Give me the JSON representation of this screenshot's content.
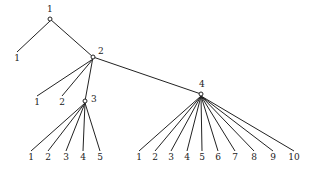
{
  "diagram": {
    "type": "tree",
    "nodes": [
      {
        "id": "n1",
        "label": "1",
        "x": 50,
        "y": 19,
        "lx": 47,
        "ly": 12,
        "marker": "circle"
      },
      {
        "id": "n2",
        "label": "2",
        "x": 93,
        "y": 57,
        "lx": 98,
        "ly": 54,
        "marker": "circle"
      },
      {
        "id": "n3",
        "label": "3",
        "x": 85,
        "y": 101,
        "lx": 91,
        "ly": 102,
        "marker": "circle"
      },
      {
        "id": "n4",
        "label": "4",
        "x": 201,
        "y": 94,
        "lx": 199,
        "ly": 87,
        "marker": "circle"
      }
    ],
    "leaves": [
      {
        "parent": "n1",
        "label": "1",
        "x": 17,
        "y": 61
      },
      {
        "parent": "n2",
        "label": "1",
        "x": 37,
        "y": 105
      },
      {
        "parent": "n2",
        "label": "2",
        "x": 62,
        "y": 105
      },
      {
        "parent": "n3",
        "label": "1",
        "x": 31,
        "y": 160
      },
      {
        "parent": "n3",
        "label": "2",
        "x": 48,
        "y": 160
      },
      {
        "parent": "n3",
        "label": "3",
        "x": 66,
        "y": 160
      },
      {
        "parent": "n3",
        "label": "4",
        "x": 83,
        "y": 160
      },
      {
        "parent": "n3",
        "label": "5",
        "x": 100,
        "y": 160
      },
      {
        "parent": "n4",
        "label": "1",
        "x": 139,
        "y": 160
      },
      {
        "parent": "n4",
        "label": "2",
        "x": 155,
        "y": 160
      },
      {
        "parent": "n4",
        "label": "3",
        "x": 171,
        "y": 160
      },
      {
        "parent": "n4",
        "label": "4",
        "x": 187,
        "y": 160
      },
      {
        "parent": "n4",
        "label": "5",
        "x": 202,
        "y": 160
      },
      {
        "parent": "n4",
        "label": "6",
        "x": 218,
        "y": 160
      },
      {
        "parent": "n4",
        "label": "7",
        "x": 235,
        "y": 160
      },
      {
        "parent": "n4",
        "label": "8",
        "x": 254,
        "y": 160
      },
      {
        "parent": "n4",
        "label": "9",
        "x": 273,
        "y": 160
      },
      {
        "parent": "n4",
        "label": "10",
        "x": 294,
        "y": 160
      }
    ],
    "edges": [
      [
        "n1",
        "n2"
      ],
      [
        "n2",
        "n3"
      ],
      [
        "n2",
        "n4"
      ]
    ]
  }
}
